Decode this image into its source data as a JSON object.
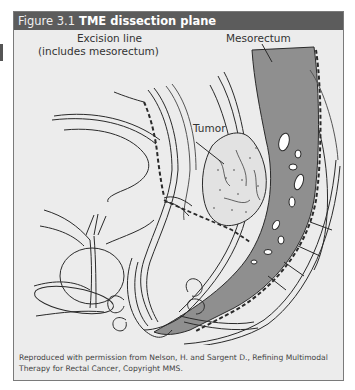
{
  "figure": {
    "number": "Figure 3.1",
    "title": "TME dissection plane",
    "labels": {
      "excision_line_1": "Excision line",
      "excision_line_2": "(includes mesorectum)",
      "mesorectum": "Mesorectum",
      "tumor": "Tumor"
    },
    "caption": "Reproduced with permission from Nelson, H. and Sargent D., Refining Multimodal Therapy for Rectal Cancer, Copyright MMS.",
    "colors": {
      "header_bg": "#5c5c5c",
      "panel_bg": "#ececec",
      "mesorectum_fill": "#8f8f8f",
      "tissue_fill": "#d6d6d6",
      "line": "#2a2a2a"
    }
  }
}
